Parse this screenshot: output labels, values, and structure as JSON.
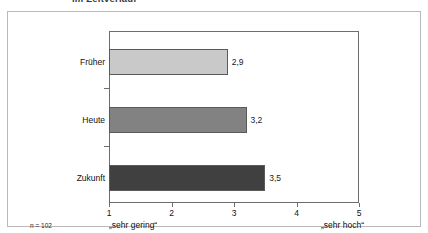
{
  "title": {
    "text": "im Zeitverlauf",
    "clipped": true
  },
  "footnote": {
    "sample_size": "n = 102"
  },
  "anchors": {
    "low": "„sehr gering“",
    "high": "„sehr hoch“"
  },
  "colors": {
    "bar_past": "#c9c9c9",
    "bar_present": "#828282",
    "bar_future": "#404040",
    "bar_outline": "#5a5a5a",
    "axis": "#6e6e6e",
    "frame": "#b9b9b9"
  },
  "chart_data": {
    "type": "bar",
    "orientation": "horizontal",
    "title": "im Zeitverlauf",
    "categories": [
      "Früher",
      "Heute",
      "Zukunft"
    ],
    "values": [
      2.9,
      3.2,
      3.5
    ],
    "value_labels": [
      "2,9",
      "3,2",
      "3,5"
    ],
    "bar_colors": [
      "#c9c9c9",
      "#828282",
      "#404040"
    ],
    "xlabel": "",
    "ylabel": "",
    "xlim": [
      1,
      5
    ],
    "xticks": [
      1,
      2,
      3,
      4,
      5
    ],
    "xtick_labels": [
      "1",
      "2",
      "3",
      "4",
      "5"
    ],
    "grid": false,
    "legend": false,
    "scale_anchor_low": "„sehr gering“",
    "scale_anchor_high": "„sehr hoch“",
    "annotation": "n = 102"
  }
}
